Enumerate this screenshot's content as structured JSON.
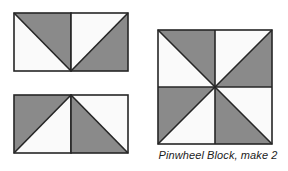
{
  "figure": {
    "background_color": "#ffffff"
  },
  "palette": {
    "dark_fabric": "#8a8a8a",
    "light_fabric": "#fafafa",
    "outline": "#262626",
    "outline_width": 1.6
  },
  "caption": {
    "text": "Pinwheel Block, make 2"
  },
  "units": [
    {
      "id": "top-strip",
      "name": "top-half-square-triangle-row",
      "rows": 1,
      "cols": 2,
      "square_size": 57,
      "squares": [
        {
          "position": "left",
          "diagonal": "tl-br",
          "dark_side": "upper-right",
          "light_side": "lower-left"
        },
        {
          "position": "right",
          "diagonal": "bl-tr",
          "dark_side": "lower-right",
          "light_side": "upper-left"
        }
      ]
    },
    {
      "id": "bottom-strip",
      "name": "bottom-half-square-triangle-row",
      "rows": 1,
      "cols": 2,
      "square_size": 57,
      "squares": [
        {
          "position": "left",
          "diagonal": "bl-tr",
          "dark_side": "upper-left",
          "light_side": "lower-right"
        },
        {
          "position": "right",
          "diagonal": "tl-br",
          "dark_side": "lower-left",
          "light_side": "upper-right"
        }
      ]
    },
    {
      "id": "pinwheel",
      "name": "assembled-pinwheel-block",
      "rows": 2,
      "cols": 2,
      "square_size": 57,
      "squares": [
        {
          "position": "top-left",
          "diagonal": "tl-br",
          "dark_side": "upper-right",
          "light_side": "lower-left"
        },
        {
          "position": "top-right",
          "diagonal": "bl-tr",
          "dark_side": "lower-right",
          "light_side": "upper-left"
        },
        {
          "position": "bottom-left",
          "diagonal": "bl-tr",
          "dark_side": "upper-left",
          "light_side": "lower-right"
        },
        {
          "position": "bottom-right",
          "diagonal": "tl-br",
          "dark_side": "lower-left",
          "light_side": "upper-right"
        }
      ]
    }
  ]
}
